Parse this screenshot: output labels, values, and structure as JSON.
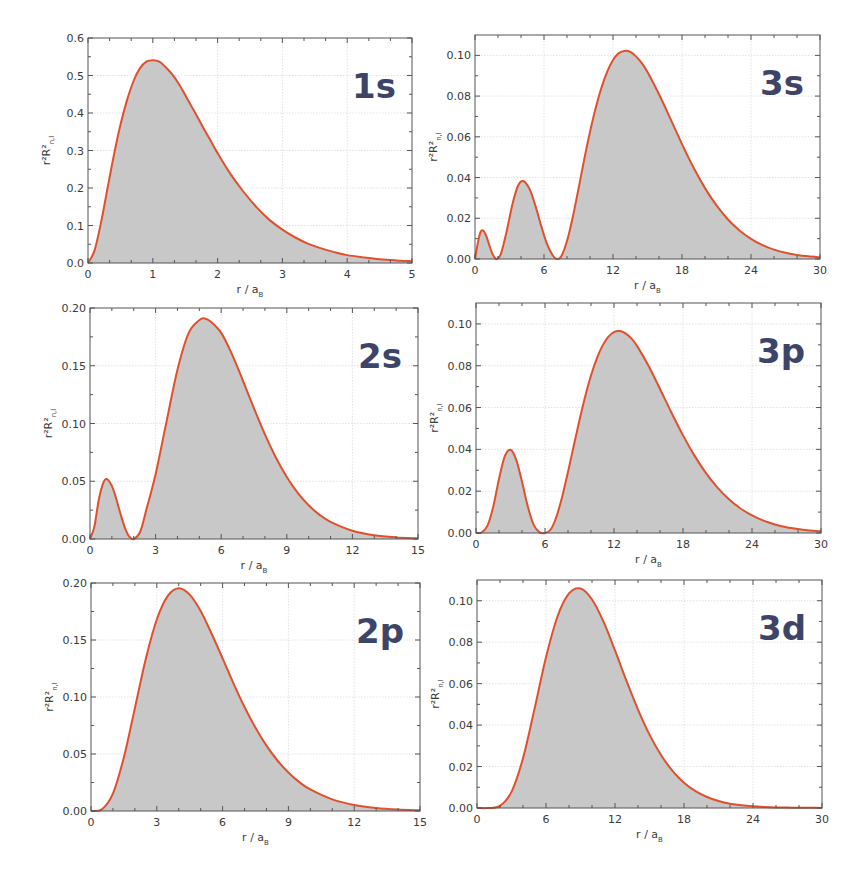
{
  "figure": {
    "footer_fragment": ""
  },
  "chart_data": [
    {
      "type": "area",
      "panel": "1s",
      "title": "1s",
      "xlabel": "r / a",
      "xlabel_sub": "B",
      "ylabel": "r²R²",
      "ylabel_sub": "n,l",
      "xlim": [
        0,
        5
      ],
      "ylim": [
        0,
        0.6
      ],
      "xticks": [
        0,
        1,
        2,
        3,
        4,
        5
      ],
      "xtick_labels": [
        "0",
        "1",
        "2",
        "3",
        "4",
        "5"
      ],
      "yticks": [
        0,
        0.1,
        0.2,
        0.3,
        0.4,
        0.5,
        0.6
      ],
      "ytick_labels": [
        "0.0",
        "0.1",
        "0.2",
        "0.3",
        "0.4",
        "0.5",
        "0.6"
      ],
      "grid": true,
      "x": [
        0,
        0.1,
        0.2,
        0.3,
        0.4,
        0.5,
        0.6,
        0.7,
        0.8,
        0.9,
        1.0,
        1.1,
        1.2,
        1.3,
        1.4,
        1.5,
        1.6,
        1.7,
        1.8,
        1.9,
        2.0,
        2.2,
        2.4,
        2.6,
        2.8,
        3.0,
        3.2,
        3.4,
        3.6,
        3.8,
        4.0,
        4.25,
        4.5,
        4.75,
        5.0
      ],
      "y": [
        0,
        0.033,
        0.107,
        0.198,
        0.288,
        0.368,
        0.433,
        0.484,
        0.519,
        0.537,
        0.541,
        0.537,
        0.522,
        0.503,
        0.478,
        0.448,
        0.417,
        0.386,
        0.354,
        0.324,
        0.293,
        0.237,
        0.19,
        0.149,
        0.115,
        0.089,
        0.068,
        0.051,
        0.039,
        0.029,
        0.021,
        0.015,
        0.01,
        0.007,
        0.005
      ]
    },
    {
      "type": "area",
      "panel": "3s",
      "title": "3s",
      "xlabel": "r / a",
      "xlabel_sub": "B",
      "ylabel": "r²R²",
      "ylabel_sub": "n,l",
      "xlim": [
        0,
        30
      ],
      "ylim": [
        0,
        0.11
      ],
      "xticks": [
        0,
        6,
        12,
        18,
        24,
        30
      ],
      "xtick_labels": [
        "0",
        "6",
        "12",
        "18",
        "24",
        "30"
      ],
      "yticks": [
        0,
        0.02,
        0.04,
        0.06,
        0.08,
        0.1
      ],
      "ytick_labels": [
        "0.00",
        "0.02",
        "0.04",
        "0.06",
        "0.08",
        "0.10"
      ],
      "grid": true,
      "x": [
        0,
        0.25,
        0.5,
        0.75,
        1.0,
        1.25,
        1.5,
        1.75,
        1.9,
        2.25,
        2.75,
        3.25,
        3.75,
        4.19,
        4.75,
        5.25,
        5.75,
        6.25,
        6.75,
        7.1,
        7.5,
        8.0,
        8.5,
        9.0,
        9.5,
        10.0,
        10.5,
        11.0,
        11.5,
        12.0,
        12.5,
        13.07,
        13.5,
        14.0,
        14.5,
        15.0,
        16.0,
        17.0,
        18.0,
        19.0,
        20.0,
        21.0,
        22.0,
        23.0,
        24.0,
        25.0,
        26.0,
        27.0,
        28.0,
        29.0,
        30.0
      ],
      "y": [
        0,
        0.008,
        0.0135,
        0.0137,
        0.011,
        0.0067,
        0.0028,
        0.0004,
        0.0,
        0.0025,
        0.0135,
        0.0268,
        0.0361,
        0.0383,
        0.0343,
        0.0262,
        0.0164,
        0.0075,
        0.0018,
        0.0,
        0.0013,
        0.0088,
        0.0205,
        0.0345,
        0.049,
        0.0624,
        0.0743,
        0.0842,
        0.092,
        0.0977,
        0.1011,
        0.1023,
        0.1017,
        0.0995,
        0.0962,
        0.0918,
        0.0809,
        0.0688,
        0.0564,
        0.0449,
        0.0348,
        0.0263,
        0.0194,
        0.014,
        0.0099,
        0.0068,
        0.0046,
        0.0031,
        0.002,
        0.0013,
        0.0008
      ]
    },
    {
      "type": "area",
      "panel": "2s",
      "title": "2s",
      "xlabel": "r / a",
      "xlabel_sub": "B",
      "ylabel": "r²R²",
      "ylabel_sub": "n,l",
      "xlim": [
        0,
        15
      ],
      "ylim": [
        0,
        0.2
      ],
      "xticks": [
        0,
        3,
        6,
        9,
        12,
        15
      ],
      "xtick_labels": [
        "0",
        "3",
        "6",
        "9",
        "12",
        "15"
      ],
      "yticks": [
        0,
        0.05,
        0.1,
        0.15,
        0.2
      ],
      "ytick_labels": [
        "0.00",
        "0.05",
        "0.10",
        "0.15",
        "0.20"
      ],
      "grid": true,
      "x": [
        0,
        0.2,
        0.4,
        0.6,
        0.76,
        1.0,
        1.2,
        1.4,
        1.6,
        1.8,
        2.0,
        2.3,
        2.6,
        3.0,
        3.5,
        4.0,
        4.5,
        5.0,
        5.24,
        5.5,
        6.0,
        6.5,
        7.0,
        7.5,
        8.0,
        8.5,
        9.0,
        9.5,
        10.0,
        10.5,
        11.0,
        12.0,
        13.0,
        14.0,
        15.0
      ],
      "y": [
        0,
        0.0107,
        0.0338,
        0.0482,
        0.0519,
        0.046,
        0.0348,
        0.0214,
        0.0095,
        0.002,
        0.0,
        0.0065,
        0.0271,
        0.056,
        0.1016,
        0.1465,
        0.1778,
        0.1895,
        0.191,
        0.1886,
        0.1785,
        0.1597,
        0.1368,
        0.1131,
        0.0906,
        0.0706,
        0.0537,
        0.04,
        0.0292,
        0.0209,
        0.0148,
        0.0071,
        0.0032,
        0.0014,
        0.0006
      ]
    },
    {
      "type": "area",
      "panel": "3p",
      "title": "3p",
      "xlabel": "r / a",
      "xlabel_sub": "B",
      "ylabel": "r²R²",
      "ylabel_sub": "n,l",
      "xlim": [
        0,
        30
      ],
      "ylim": [
        0,
        0.11
      ],
      "xticks": [
        0,
        6,
        12,
        18,
        24,
        30
      ],
      "xtick_labels": [
        "0",
        "6",
        "12",
        "18",
        "24",
        "30"
      ],
      "yticks": [
        0,
        0.02,
        0.04,
        0.06,
        0.08,
        0.1
      ],
      "ytick_labels": [
        "0.00",
        "0.02",
        "0.04",
        "0.06",
        "0.08",
        "0.10"
      ],
      "grid": true,
      "x": [
        0,
        0.5,
        1.0,
        1.5,
        2.0,
        2.5,
        3.0,
        3.5,
        4.0,
        4.5,
        5.0,
        5.5,
        6.0,
        6.5,
        7.0,
        7.5,
        8.0,
        8.5,
        9.0,
        9.5,
        10.0,
        10.5,
        11.0,
        11.5,
        12.0,
        12.5,
        13.0,
        13.5,
        14.0,
        15.0,
        16.0,
        17.0,
        18.0,
        19.0,
        20.0,
        21.0,
        22.0,
        23.0,
        24.0,
        25.0,
        26.0,
        27.0,
        28.0,
        29.0,
        30.0
      ],
      "y": [
        0,
        0.0003,
        0.0035,
        0.0126,
        0.0258,
        0.0366,
        0.0398,
        0.035,
        0.0245,
        0.0128,
        0.0041,
        0.0004,
        0.0,
        0.0017,
        0.0079,
        0.0175,
        0.0292,
        0.0417,
        0.054,
        0.0654,
        0.0753,
        0.0834,
        0.0896,
        0.0938,
        0.0961,
        0.0966,
        0.0955,
        0.0931,
        0.0895,
        0.08,
        0.0689,
        0.0575,
        0.0467,
        0.037,
        0.0286,
        0.0217,
        0.0161,
        0.0117,
        0.0084,
        0.0059,
        0.0041,
        0.0028,
        0.0019,
        0.0012,
        0.0008
      ]
    },
    {
      "type": "area",
      "panel": "2p",
      "title": "2p",
      "xlabel": "r / a",
      "xlabel_sub": "B",
      "ylabel": "r²R²",
      "ylabel_sub": "n,l",
      "xlim": [
        0,
        15
      ],
      "ylim": [
        0,
        0.2
      ],
      "xticks": [
        0,
        3,
        6,
        9,
        12,
        15
      ],
      "xtick_labels": [
        "0",
        "3",
        "6",
        "9",
        "12",
        "15"
      ],
      "yticks": [
        0,
        0.05,
        0.1,
        0.15,
        0.2
      ],
      "ytick_labels": [
        "0.00",
        "0.05",
        "0.10",
        "0.15",
        "0.20"
      ],
      "grid": true,
      "x": [
        0,
        0.5,
        1.0,
        1.5,
        2.0,
        2.5,
        3.0,
        3.5,
        4.0,
        4.5,
        5.0,
        5.5,
        6.0,
        6.5,
        7.0,
        7.5,
        8.0,
        8.5,
        9.0,
        9.5,
        10.0,
        11.0,
        12.0,
        13.0,
        14.0,
        15.0
      ],
      "y": [
        0,
        0.0016,
        0.0153,
        0.0472,
        0.0902,
        0.1336,
        0.168,
        0.1887,
        0.1954,
        0.1898,
        0.1755,
        0.1555,
        0.1339,
        0.1118,
        0.0912,
        0.073,
        0.0573,
        0.0443,
        0.0337,
        0.0253,
        0.0189,
        0.0102,
        0.0053,
        0.0027,
        0.0013,
        0.0006
      ]
    },
    {
      "type": "area",
      "panel": "3d",
      "title": "3d",
      "xlabel": "r / a",
      "xlabel_sub": "B",
      "ylabel": "r²R²",
      "ylabel_sub": "n,l",
      "xlim": [
        0,
        30
      ],
      "ylim": [
        0,
        0.11
      ],
      "xticks": [
        0,
        6,
        12,
        18,
        24,
        30
      ],
      "xtick_labels": [
        "0",
        "6",
        "12",
        "18",
        "24",
        "30"
      ],
      "yticks": [
        0,
        0.02,
        0.04,
        0.06,
        0.08,
        0.1
      ],
      "ytick_labels": [
        "0.00",
        "0.02",
        "0.04",
        "0.06",
        "0.08",
        "0.10"
      ],
      "grid": true,
      "x": [
        0,
        1.0,
        2.0,
        3.0,
        4.0,
        5.0,
        6.0,
        7.0,
        8.0,
        9.0,
        10.0,
        11.0,
        12.0,
        13.0,
        14.0,
        15.0,
        16.0,
        17.0,
        18.0,
        19.0,
        20.0,
        21.0,
        22.0,
        23.0,
        24.0,
        25.0,
        26.0,
        27.0,
        28.0,
        29.0,
        30.0
      ],
      "y": [
        0,
        0.0,
        0.001,
        0.0078,
        0.024,
        0.0478,
        0.0727,
        0.0924,
        0.1035,
        0.1059,
        0.1006,
        0.0899,
        0.076,
        0.0613,
        0.0475,
        0.0354,
        0.0256,
        0.0179,
        0.0122,
        0.0081,
        0.0053,
        0.0034,
        0.0021,
        0.0013,
        0.0008,
        0.0005,
        0.0003,
        0.0002,
        0.0001,
        0.0001,
        0.0
      ]
    }
  ]
}
